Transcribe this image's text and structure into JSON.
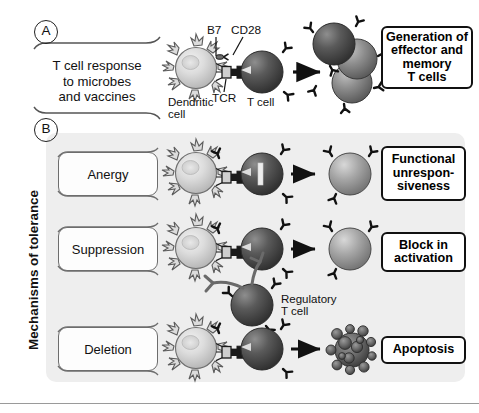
{
  "figure": {
    "background_color": "#ffffff",
    "panel_b_background": "#eeeeee"
  },
  "panels": [
    {
      "letter": "A",
      "stimulus_label": "T cell response\nto microbes\nand vaccines",
      "stimulus_lines": [
        "T cell response",
        "to microbes",
        "and vaccines"
      ],
      "outcome_label": "Generation of\neffector and\nmemory\nT cells",
      "outcome_lines": [
        "Generation of",
        "effector and",
        "memory",
        "T cells"
      ],
      "cell_labels": [
        {
          "name": "dendritic-cell",
          "lines": [
            "Dendritic",
            "cell"
          ]
        },
        {
          "name": "t-cell",
          "lines": [
            "T cell"
          ]
        }
      ],
      "molecule_labels": [
        {
          "name": "b7",
          "text": "B7"
        },
        {
          "name": "cd28",
          "text": "CD28"
        },
        {
          "name": "tcr",
          "text": "TCR"
        }
      ]
    },
    {
      "letter": "B",
      "axis_label": "Mechanisms of tolerance",
      "rows": [
        {
          "mechanism": "Anergy",
          "outcome_lines": [
            "Functional",
            "unrespon-",
            "siveness"
          ],
          "note": "blocked T cell with inhibition bar"
        },
        {
          "mechanism": "Suppression",
          "outcome_lines": [
            "Block in",
            "activation"
          ],
          "extra_cell_lines": [
            "Regulatory",
            "T cell"
          ]
        },
        {
          "mechanism": "Deletion",
          "outcome_lines": [
            "Apoptosis"
          ],
          "note": "apoptotic fragmenting cell"
        }
      ]
    }
  ],
  "colors": {
    "line": "#111111",
    "row_label_border": "#6d6d6d",
    "panel_bg": "#eeeeee",
    "dendritic_light": "#d9d9d9",
    "tcell_dark": "#4a4a4a",
    "tcell_mid": "#7d7d7d",
    "apoptotic": "#5d5d5d",
    "rule": "#9a9a9a"
  }
}
